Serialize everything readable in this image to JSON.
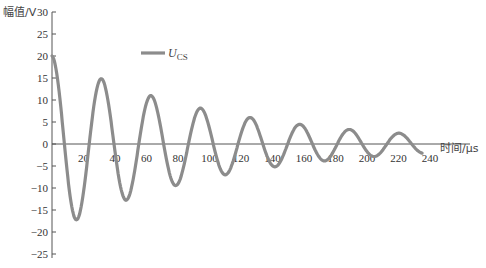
{
  "chart_data": {
    "type": "line",
    "title": "",
    "xlabel": "时间/μs",
    "ylabel": "幅值/V",
    "xlim": [
      0,
      240
    ],
    "ylim": [
      -25,
      30
    ],
    "x_ticks": [
      20,
      40,
      60,
      80,
      100,
      120,
      140,
      160,
      180,
      200,
      220,
      240
    ],
    "y_ticks": [
      30,
      25,
      20,
      15,
      10,
      5,
      0,
      -5,
      -10,
      -15,
      -20,
      -25
    ],
    "grid": false,
    "legend_position": "upper-center",
    "series": [
      {
        "name": "U_CS",
        "color": "#8c8c8c",
        "model": "damped cosine: 20*exp(-t/105)*cos(2*pi*t/31.5)",
        "x": [
          0,
          15,
          31,
          47,
          63,
          79,
          95,
          110,
          126,
          141,
          157,
          173,
          188,
          204,
          220,
          235
        ],
        "values": [
          20,
          -17,
          14.5,
          -12.5,
          10.5,
          -9,
          8,
          -6.5,
          5.5,
          -4.5,
          4.5,
          -3,
          3.5,
          -2.5,
          2.5,
          -1.5
        ]
      }
    ]
  },
  "axes": {
    "ylabel": "幅值/V",
    "xlabel": "时间/μs"
  },
  "legend": {
    "symbol": "U",
    "subscript": "CS"
  }
}
